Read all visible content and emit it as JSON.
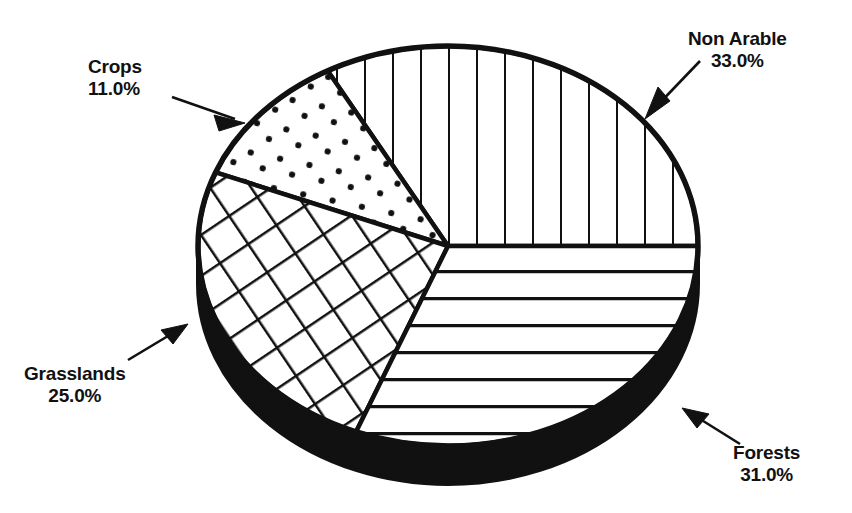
{
  "chart_data": {
    "type": "pie",
    "title": "",
    "subtitle": "",
    "xlabel": "",
    "ylabel": "",
    "legend_position": "callout-labels",
    "grid": false,
    "value_unit": "%",
    "categories": [
      "Non Arable",
      "Forests",
      "Grasslands",
      "Crops"
    ],
    "values": [
      33.0,
      31.0,
      25.0,
      11.0
    ],
    "slices": [
      {
        "name": "Non Arable",
        "label": "Non Arable",
        "value": 33.0,
        "value_text": "33.0%",
        "fill_pattern": "vertical-lines",
        "start_angle_deg": 0,
        "end_angle_deg": 118.8
      },
      {
        "name": "Forests",
        "label": "Forests",
        "value": 31.0,
        "value_text": "31.0%",
        "fill_pattern": "horizontal-lines",
        "start_angle_deg": 248.4,
        "end_angle_deg": 360
      },
      {
        "name": "Grasslands",
        "label": "Grasslands",
        "value": 25.0,
        "value_text": "25.0%",
        "fill_pattern": "crosshatch-grid",
        "start_angle_deg": 158.4,
        "end_angle_deg": 248.4
      },
      {
        "name": "Crops",
        "label": "Crops",
        "value": 11.0,
        "value_text": "11.0%",
        "fill_pattern": "dots-stipple",
        "start_angle_deg": 118.8,
        "end_angle_deg": 158.4
      }
    ],
    "colors": {
      "outline": "#111111",
      "fill": "#ffffff",
      "side_rim": "#111111",
      "text": "#111111",
      "background": "#ffffff"
    },
    "style": {
      "three_d": true,
      "depth_px": 38,
      "center_x": 448,
      "center_y": 246,
      "radius_x": 250,
      "radius_y": 200
    }
  },
  "labels": {
    "crops": {
      "name": "Crops",
      "pct": "11.0%"
    },
    "non_arable": {
      "name": "Non Arable",
      "pct": "33.0%"
    },
    "grasslands": {
      "name": "Grasslands",
      "pct": "25.0%"
    },
    "forests": {
      "name": "Forests",
      "pct": "31.0%"
    }
  }
}
